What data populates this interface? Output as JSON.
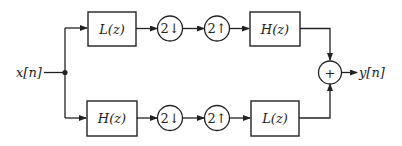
{
  "diagram": {
    "input_label": "x[n]",
    "output_label": "y[n]",
    "summer_symbol": "+",
    "top_branch": {
      "analysis_filter": "L(z)",
      "downsampler": "2↓",
      "upsampler": "2↑",
      "synthesis_filter": "H(z)"
    },
    "bottom_branch": {
      "analysis_filter": "H(z)",
      "downsampler": "2↓",
      "upsampler": "2↑",
      "synthesis_filter": "L(z)"
    },
    "colors": {
      "stroke": "#222222",
      "background": "#ffffff"
    }
  }
}
